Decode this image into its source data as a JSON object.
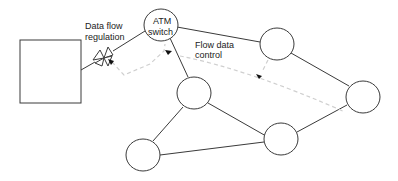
{
  "diagram": {
    "labels": {
      "regulation_line1": "Data flow",
      "regulation_line2": "regulation",
      "atm_line1": "ATM",
      "atm_line2": "switch",
      "control_line1": "Flow data",
      "control_line2": "control"
    },
    "nodes": [
      {
        "id": "host",
        "shape": "rect",
        "x": 20,
        "y": 40,
        "w": 61,
        "h": 63
      },
      {
        "id": "atm-switch",
        "shape": "circle",
        "cx": 161,
        "cy": 25,
        "r": 17
      },
      {
        "id": "node-top-right",
        "shape": "circle",
        "cx": 277,
        "cy": 44,
        "r": 17
      },
      {
        "id": "node-middle",
        "shape": "circle",
        "cx": 194,
        "cy": 93,
        "r": 17
      },
      {
        "id": "node-far-right",
        "shape": "circle",
        "cx": 363,
        "cy": 96,
        "r": 17
      },
      {
        "id": "node-bottom-center",
        "shape": "circle",
        "cx": 281,
        "cy": 139,
        "r": 17
      },
      {
        "id": "node-bottom-left",
        "shape": "circle",
        "cx": 143,
        "cy": 155,
        "r": 17
      }
    ],
    "colors": {
      "line": "#333333",
      "dashed": "#c8c8c8",
      "arrow": "#111111"
    }
  }
}
